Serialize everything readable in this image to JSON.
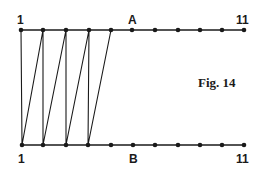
{
  "figure": {
    "caption": "Fig. 14",
    "top_line": {
      "label_start": "1",
      "label_mid": "A",
      "label_end": "11",
      "y": 30,
      "points_x": [
        21,
        43,
        66,
        89,
        111,
        132,
        155,
        178,
        200,
        222,
        244
      ]
    },
    "bottom_line": {
      "label_start": "1",
      "label_mid": "B",
      "label_end": "11",
      "y": 145,
      "points_x": [
        22,
        43,
        66,
        88,
        111,
        133,
        155,
        178,
        200,
        222,
        244
      ]
    },
    "zigzag_path": [
      [
        21,
        30
      ],
      [
        22,
        145
      ],
      [
        43,
        30
      ],
      [
        43,
        145
      ],
      [
        66,
        30
      ],
      [
        66,
        145
      ],
      [
        89,
        30
      ],
      [
        88,
        145
      ],
      [
        111,
        30
      ]
    ],
    "line_color": "#1a1a1a"
  }
}
